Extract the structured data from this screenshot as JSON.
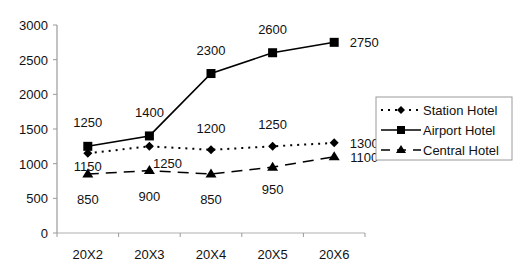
{
  "chart_data": {
    "type": "line",
    "title": "",
    "xlabel": "",
    "ylabel": "",
    "categories": [
      "20X2",
      "20X3",
      "20X4",
      "20X5",
      "20X6"
    ],
    "ylim": [
      0,
      3000
    ],
    "yticks": [
      0,
      500,
      1000,
      1500,
      2000,
      2500,
      3000
    ],
    "ytick_labels": [
      "0",
      "500",
      "1000",
      "1500",
      "2000",
      "2500",
      "3000"
    ],
    "grid": false,
    "legend_position": "right",
    "series": [
      {
        "name": "Station Hotel",
        "values": [
          1150,
          1250,
          1200,
          1250,
          1300
        ],
        "line_style": "dotted",
        "marker": "diamond",
        "color": "#000000"
      },
      {
        "name": "Airport Hotel",
        "values": [
          1250,
          1400,
          2300,
          2600,
          2750
        ],
        "line_style": "solid",
        "marker": "square",
        "color": "#000000"
      },
      {
        "name": "Central Hotel",
        "values": [
          850,
          900,
          850,
          950,
          1100
        ],
        "line_style": "dashed",
        "marker": "triangle",
        "color": "#000000"
      }
    ]
  },
  "legend": {
    "items": [
      "Station Hotel",
      "Airport Hotel",
      "Central Hotel"
    ]
  }
}
